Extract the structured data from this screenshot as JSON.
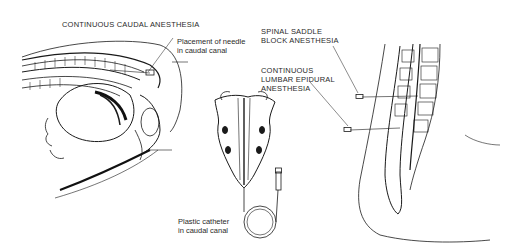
{
  "diagram": {
    "title": "CONTINUOUS CAUDAL ANESTHESIA",
    "labels": {
      "needle_placement_line1": "Placement of needle",
      "needle_placement_line2": "in caudal canal",
      "catheter_line1": "Plastic catheter",
      "catheter_line2": "in caudal canal",
      "spinal_saddle_line1": "SPINAL SADDLE",
      "spinal_saddle_line2": "BLOCK ANESTHESIA",
      "lumbar_epidural_line1": "CONTINUOUS",
      "lumbar_epidural_line2": "LUMBAR EPIDURAL",
      "lumbar_epidural_line3": "ANESTHESIA"
    },
    "panels": [
      "sagittal-section-mother-and-fetus",
      "sacrum-posterior-view-with-catheter",
      "lumbar-spine-sagittal-section"
    ],
    "colors": {
      "ink": "#1a1a1a",
      "background": "#ffffff"
    }
  }
}
